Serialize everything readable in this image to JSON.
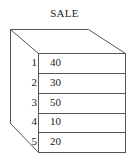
{
  "title": "SALE",
  "rows": [
    {
      "index": "1",
      "value": "40"
    },
    {
      "index": "2",
      "value": "30"
    },
    {
      "index": "3",
      "value": "50"
    },
    {
      "index": "4",
      "value": "10"
    },
    {
      "index": "5",
      "value": "20"
    }
  ],
  "colors": {
    "line": "#555555",
    "text": "#222222"
  }
}
